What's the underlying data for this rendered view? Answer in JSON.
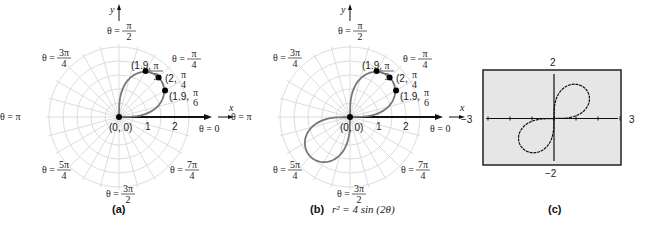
{
  "panels": [
    {
      "id": "a",
      "caption": "(a)",
      "equation": "",
      "axis_x": "x",
      "axis_y": "y",
      "origin_label": "(0, 0)",
      "ticks": [
        "1",
        "2"
      ],
      "angle_labels": [
        {
          "angle": "0",
          "text": "θ = 0"
        },
        {
          "angle": "π/4",
          "text": "θ = π/4"
        },
        {
          "angle": "π/2",
          "text": "θ = π/2"
        },
        {
          "angle": "3π/4",
          "text": "θ = 3π/4"
        },
        {
          "angle": "π",
          "text": "θ = π"
        },
        {
          "angle": "5π/4",
          "text": "θ = 5π/4"
        },
        {
          "angle": "3π/2",
          "text": "θ = 3π/2"
        },
        {
          "angle": "7π/4",
          "text": "θ = 7π/4"
        }
      ],
      "points": [
        {
          "r": 1.9,
          "theta": "π/3",
          "label": "(1.9, π/3)"
        },
        {
          "r": 2,
          "theta": "π/4",
          "label": "(2, π/4)"
        },
        {
          "r": 1.9,
          "theta": "π/6",
          "label": "(1.9, π/6)"
        }
      ],
      "curve": "r² = 4 sin(2θ), 0 ≤ θ ≤ π/2 (one petal)"
    },
    {
      "id": "b",
      "caption": "(b)",
      "equation": "r² = 4 sin (2θ)",
      "axis_x": "x",
      "axis_y": "y",
      "origin_label": "(0, 0)",
      "ticks": [
        "1",
        "2"
      ],
      "points": [
        {
          "r": 1.9,
          "theta": "π/3",
          "label": "(1.9, π/3)"
        },
        {
          "r": 2,
          "theta": "π/4",
          "label": "(2, π/4)"
        },
        {
          "r": 1.9,
          "theta": "π/6",
          "label": "(1.9, π/6)"
        }
      ],
      "curve": "r² = 4 sin(2θ), both petals"
    },
    {
      "id": "c",
      "caption": "(c)",
      "window": {
        "xmin": "−3",
        "xmax": "3",
        "ymin": "−2",
        "ymax": "2"
      },
      "curve": "graphing-calculator lemniscate"
    }
  ],
  "text": {
    "theta0": "θ = 0",
    "theta_pi": "θ = π",
    "pi": "π",
    "two": "2",
    "four": "4",
    "three_pi": "3π",
    "five_pi": "5π",
    "seven_pi": "7π",
    "three": "3",
    "six": "6",
    "theta_eq": "θ =",
    "caption_a": "(a)",
    "caption_b": "(b)",
    "caption_c": "(c)",
    "eq_b": "r² = 4 sin (2θ)",
    "x": "x",
    "y": "y",
    "origin": "(0, 0)",
    "tick1": "1",
    "tick2": "2",
    "p1": "(1.9,",
    "p2": "(2,",
    "p3": "(1.9,",
    "c_ymax": "2",
    "c_ymin": "−2",
    "c_xmin": "−3",
    "c_xmax": "3"
  }
}
